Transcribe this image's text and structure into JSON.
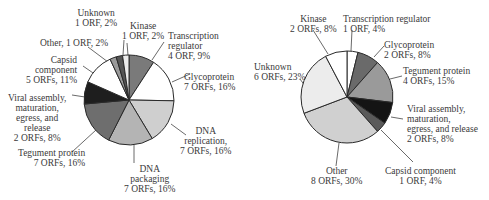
{
  "chart_data": [
    {
      "type": "pie",
      "title": "",
      "center": [
        129,
        100
      ],
      "radius": 45,
      "start_angle_deg": 0,
      "direction": "clockwise",
      "slices": [
        {
          "label": "Transcription regulator",
          "orfs": "4 ORF",
          "percent": 9,
          "value": 4,
          "color": "#7a7a7a"
        },
        {
          "label": "Glycoprotein",
          "orfs": "7 ORFs",
          "percent": 16,
          "value": 7,
          "color": "#ffffff"
        },
        {
          "label": "DNA replication",
          "orfs": "7 ORFs",
          "percent": 16,
          "value": 7,
          "color": "#cfcfcf"
        },
        {
          "label": "DNA packaging",
          "orfs": "7 ORFs",
          "percent": 16,
          "value": 7,
          "color": "#b4b4b4"
        },
        {
          "label": "Tegument protein",
          "orfs": "7 ORFs",
          "percent": 16,
          "value": 7,
          "color": "#6e6e6e"
        },
        {
          "label": "Viral assembly, maturation, egress, and release",
          "orfs": "2 ORFs",
          "percent": 8,
          "value": 3.5,
          "color": "#1e1e1e"
        },
        {
          "label": "Capsid component",
          "orfs": "5 ORFs",
          "percent": 11,
          "value": 5,
          "color": "#ffffff"
        },
        {
          "label": "Other",
          "orfs": "1 ORF",
          "percent": 2,
          "value": 1,
          "color": "#9a9a9a"
        },
        {
          "label": "Unknown",
          "orfs": "1 ORF",
          "percent": 2,
          "value": 1,
          "color": "#555555"
        },
        {
          "label": "Kinase",
          "orfs": "1 ORF",
          "percent": 2,
          "value": 1,
          "color": "#ececec"
        }
      ],
      "labels": [
        {
          "lines": [
            "Unknown",
            "1 ORF, 2%"
          ],
          "x": 75,
          "y": 8,
          "align": "c"
        },
        {
          "lines": [
            "Kinase",
            "1 ORF, 2%"
          ],
          "x": 122,
          "y": 21,
          "align": "c"
        },
        {
          "lines": [
            "Transcription",
            "regulator",
            "4 ORF, 9%"
          ],
          "x": 168,
          "y": 31,
          "align": "l"
        },
        {
          "lines": [
            "Other, 1 ORF,  2%"
          ],
          "x": 40,
          "y": 38,
          "align": "l"
        },
        {
          "lines": [
            "Capsid",
            "component",
            "5 ORFs, 11%"
          ],
          "x": 26,
          "y": 55,
          "align": "r"
        },
        {
          "lines": [
            "Glycoprotein",
            "7 ORFs, 16%"
          ],
          "x": 184,
          "y": 72,
          "align": "l"
        },
        {
          "lines": [
            "Viral assembly,",
            "maturation,",
            "egress, and",
            "release",
            "2 ORFs, 8%"
          ],
          "x": 8,
          "y": 93,
          "align": "c"
        },
        {
          "lines": [
            "DNA",
            "replication,",
            "7 ORFs, 16%"
          ],
          "x": 180,
          "y": 126,
          "align": "c"
        },
        {
          "lines": [
            "Tegument protein",
            "7 ORFs, 16%"
          ],
          "x": 18,
          "y": 148,
          "align": "r"
        },
        {
          "lines": [
            "DNA",
            "packaging",
            "7 ORFs, 16%"
          ],
          "x": 124,
          "y": 164,
          "align": "c"
        }
      ]
    },
    {
      "type": "pie",
      "title": "",
      "center": [
        347,
        97
      ],
      "radius": 46,
      "start_angle_deg": 0,
      "direction": "clockwise",
      "slices": [
        {
          "label": "Transcription regulator",
          "orfs": "1 ORF",
          "percent": 4,
          "value": 1,
          "color": "#ffffff"
        },
        {
          "label": "Glycoprotein",
          "orfs": "2 ORFs",
          "percent": 8,
          "value": 2,
          "color": "#6a6a6a"
        },
        {
          "label": "Tegument protein",
          "orfs": "4 ORFs",
          "percent": 15,
          "value": 4,
          "color": "#9a9a9a"
        },
        {
          "label": "Viral assembly, maturation, egress, and release",
          "orfs": "2 ORFs",
          "percent": 8,
          "value": 2,
          "color": "#141414"
        },
        {
          "label": "Capsid component",
          "orfs": "1 ORF",
          "percent": 4,
          "value": 1,
          "color": "#5a5a5a"
        },
        {
          "label": "Other",
          "orfs": "8 ORFs",
          "percent": 30,
          "value": 8,
          "color": "#d0d0d0"
        },
        {
          "label": "Unknown",
          "orfs": "6 ORFs",
          "percent": 23,
          "value": 6,
          "color": "#ececec"
        },
        {
          "label": "Kinase",
          "orfs": "2 ORFs",
          "percent": 8,
          "value": 2,
          "color": "#ffffff"
        }
      ],
      "labels": [
        {
          "lines": [
            "Kinase",
            "2 ORFs, 8%"
          ],
          "x": 290,
          "y": 14,
          "align": "c"
        },
        {
          "lines": [
            "Transcription regulator",
            "1 ORF, 4%"
          ],
          "x": 343,
          "y": 14,
          "align": "l"
        },
        {
          "lines": [
            "Glycoprotein",
            "2 ORFs, 8%"
          ],
          "x": 384,
          "y": 40,
          "align": "l"
        },
        {
          "lines": [
            "Unknown",
            "6 ORFs, 23%"
          ],
          "x": 254,
          "y": 62,
          "align": "l"
        },
        {
          "lines": [
            "Tegument protein",
            "4 ORFs, 15%"
          ],
          "x": 403,
          "y": 66,
          "align": "l"
        },
        {
          "lines": [
            "Viral assembly,",
            "maturation,",
            "egress, and release",
            "2 ORFs, 8%"
          ],
          "x": 407,
          "y": 104,
          "align": "l"
        },
        {
          "lines": [
            "Other",
            "8 ORFs, 30%"
          ],
          "x": 311,
          "y": 166,
          "align": "c"
        },
        {
          "lines": [
            "Capsid component",
            "1 ORF, 4%"
          ],
          "x": 385,
          "y": 166,
          "align": "c"
        }
      ]
    }
  ],
  "leader_lines": [
    [
      [
        124,
        40
      ],
      [
        123,
        55
      ]
    ],
    [
      [
        127,
        43
      ],
      [
        128,
        55
      ]
    ],
    [
      [
        164,
        42
      ],
      [
        152,
        60
      ]
    ],
    [
      [
        88,
        47
      ],
      [
        108,
        62
      ]
    ],
    [
      [
        83,
        66
      ],
      [
        96,
        75
      ]
    ],
    [
      [
        72,
        95
      ],
      [
        85,
        97
      ]
    ],
    [
      [
        190,
        74
      ],
      [
        172,
        82
      ]
    ],
    [
      [
        186,
        135
      ],
      [
        171,
        124
      ]
    ],
    [
      [
        72,
        152
      ],
      [
        96,
        130
      ]
    ],
    [
      [
        134,
        163
      ],
      [
        134,
        145
      ]
    ],
    [
      [
        313,
        30
      ],
      [
        328,
        54
      ]
    ],
    [
      [
        352,
        30
      ],
      [
        351,
        51
      ]
    ],
    [
      [
        384,
        46
      ],
      [
        374,
        57
      ]
    ],
    [
      [
        300,
        79
      ],
      [
        305,
        86
      ]
    ],
    [
      [
        402,
        76
      ],
      [
        390,
        79
      ]
    ],
    [
      [
        403,
        119
      ],
      [
        391,
        117
      ]
    ],
    [
      [
        336,
        166
      ],
      [
        339,
        143
      ]
    ],
    [
      [
        413,
        162
      ],
      [
        381,
        130
      ]
    ]
  ]
}
